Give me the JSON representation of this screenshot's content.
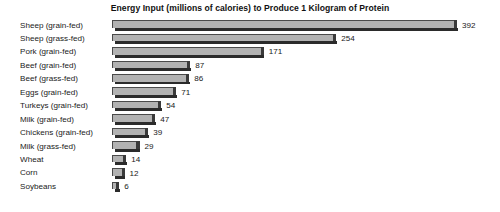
{
  "chart_data": {
    "type": "bar",
    "orientation": "horizontal",
    "title": "Energy Input (millions of calories) to Produce 1 Kilogram of Protein",
    "xlabel": "",
    "ylabel": "",
    "grid": false,
    "legend": null,
    "xlim": [
      0,
      392
    ],
    "categories": [
      "Sheep (grain-fed)",
      "Sheep (grass-fed)",
      "Pork (grain-fed)",
      "Beef (grain-fed)",
      "Beef (grass-fed)",
      "Eggs (grain-fed)",
      "Turkeys (grain-fed)",
      "Milk (grain-fed)",
      "Chickens (grain-fed)",
      "Milk (grass-fed)",
      "Wheat",
      "Corn",
      "Soybeans"
    ],
    "values": [
      392,
      254,
      171,
      87,
      86,
      71,
      54,
      47,
      39,
      29,
      14,
      12,
      6
    ],
    "value_labels": [
      "392",
      "254",
      "171",
      "87",
      "86",
      "71",
      "54",
      "47",
      "39",
      "29",
      "14",
      "12",
      "6"
    ],
    "bar_color": "#b2b2b2",
    "bar_shadow_color": "#2b2b2b",
    "background_color": "#ffffff",
    "text_color": "#1a1a1a"
  }
}
